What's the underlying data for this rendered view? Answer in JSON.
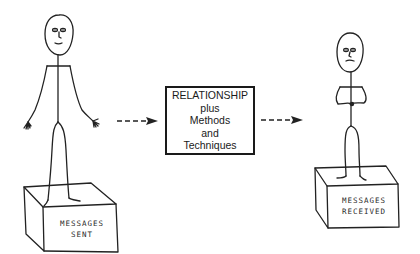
{
  "diagram": {
    "center_box": {
      "lines": [
        "RELATIONSHIP",
        "plus",
        "Methods",
        "and",
        "Techniques"
      ]
    },
    "sender": {
      "label_lines": [
        "MESSAGES",
        "SENT"
      ],
      "pose": "arms-open"
    },
    "receiver": {
      "label_lines": [
        "MESSAGES",
        "RECEIVED"
      ],
      "pose": "arms-folded"
    },
    "arrows": [
      {
        "from": "sender",
        "to": "center_box",
        "style": "dashed"
      },
      {
        "from": "center_box",
        "to": "receiver",
        "style": "dashed"
      }
    ],
    "colors": {
      "ink": "#222222",
      "background": "#ffffff"
    }
  }
}
